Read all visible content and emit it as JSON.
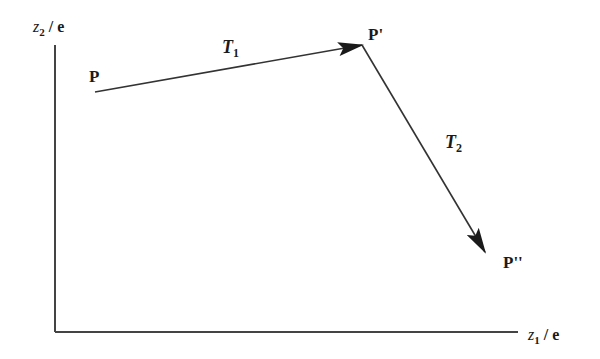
{
  "diagram": {
    "axes": {
      "y_label": {
        "var": "z",
        "sub": "2",
        "suffix": " / e"
      },
      "x_label": {
        "var": "z",
        "sub": "1",
        "suffix": " / e"
      }
    },
    "points": {
      "p": "P",
      "p_prime": "P'",
      "p_double_prime": "P''"
    },
    "transforms": {
      "t1": {
        "var": "T",
        "sub": "1"
      },
      "t2": {
        "var": "T",
        "sub": "2"
      }
    },
    "colors": {
      "line": "#333333",
      "text": "#1a1a1a"
    }
  }
}
